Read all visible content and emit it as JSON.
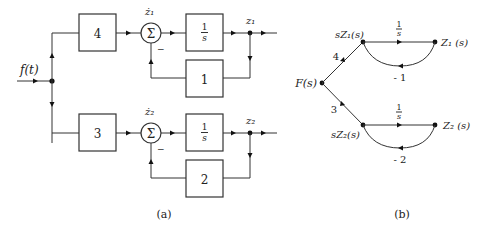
{
  "panel_a": {
    "caption": "(a)",
    "input_label": "f(t)",
    "top": {
      "gain": "4",
      "sum_label": "ż₁",
      "sum_symbol": "Σ",
      "sum_sign": "−",
      "integrator_num": "1",
      "integrator_den": "s",
      "feedback_gain": "1",
      "output_label": "z₁"
    },
    "bottom": {
      "gain": "3",
      "sum_label": "ż₂",
      "sum_symbol": "Σ",
      "sum_sign": "−",
      "integrator_num": "1",
      "integrator_den": "s",
      "feedback_gain": "2",
      "output_label": "z₂"
    }
  },
  "panel_b": {
    "caption": "(b)",
    "source_node": "F(s)",
    "top": {
      "branch_gain": "4",
      "node_left": "sZ₁(s)",
      "forward_gain_num": "1",
      "forward_gain_den": "s",
      "node_right": "Z₁ (s)",
      "feedback_gain": "- 1"
    },
    "bottom": {
      "branch_gain": "3",
      "node_left": "sZ₂(s)",
      "forward_gain_num": "1",
      "forward_gain_den": "s",
      "node_right": "Z₂ (s)",
      "feedback_gain": "- 2"
    }
  }
}
